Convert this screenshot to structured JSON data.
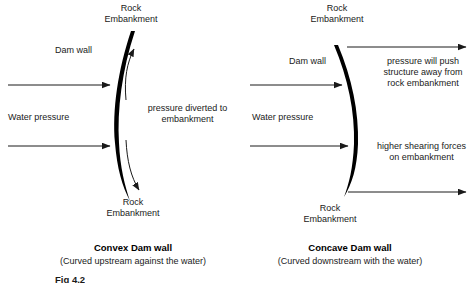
{
  "figure": {
    "caption_label": "Fig 4.2",
    "panels": [
      {
        "id": "convex",
        "top_embankment_line1": "Rock",
        "top_embankment_line2": "Embankment",
        "bottom_embankment_line1": "Rock",
        "bottom_embankment_line2": "Embankment",
        "dam_wall_label": "Dam wall",
        "water_pressure_label": "Water pressure",
        "annotation_line1": "pressure diverted to",
        "annotation_line2": "embankment",
        "title": "Convex Dam wall",
        "subtitle": "(Curved upstream against the water)"
      },
      {
        "id": "concave",
        "top_embankment_line1": "Rock",
        "top_embankment_line2": "Embankment",
        "bottom_embankment_line1": "Rock",
        "bottom_embankment_line2": "Embankment",
        "dam_wall_label": "Dam wall",
        "water_pressure_label": "Water pressure",
        "annotation_top_line1": "pressure will push",
        "annotation_top_line2": "structure away from",
        "annotation_top_line3": "rock embankment",
        "annotation_bottom_line1": "higher shearing forces",
        "annotation_bottom_line2": "on embankment",
        "title": "Concave Dam wall",
        "subtitle": "(Curved downstream with the water)"
      }
    ]
  },
  "colors": {
    "ink": "#1a1a1a",
    "wall": "#000000",
    "background": "#ffffff"
  }
}
